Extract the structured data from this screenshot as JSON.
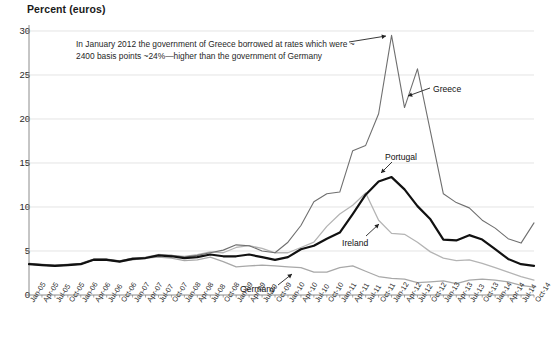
{
  "chart_data": {
    "type": "line",
    "title": "Percent (euros)",
    "ylabel": "Percent (euros)",
    "xlabel": "",
    "ylim": [
      0,
      30
    ],
    "yticks": [
      0,
      5,
      10,
      15,
      20,
      25,
      30
    ],
    "grid": true,
    "legend_position": "inline-annotations",
    "annotations": [
      {
        "name": "greece-callout",
        "line1": "In January 2012 the government of Greece borrowed at rates which were ~",
        "line2": "2400 basis points ~24%—higher than the government of Germany"
      }
    ],
    "inline_labels": [
      {
        "name": "Greece",
        "text": "Greece"
      },
      {
        "name": "Portugal",
        "text": "Portugal"
      },
      {
        "name": "Ireland",
        "text": "Ireland"
      },
      {
        "name": "Germany",
        "text": "Germany"
      }
    ],
    "colors": {
      "greece": "#6f6f6f",
      "portugal": "#111111",
      "ireland": "#b4b4b4",
      "germany": "#a8a8a8",
      "grid": "#d8d8d8",
      "axis": "#808080",
      "background": "#ffffff"
    },
    "categories": [
      "Jan-05",
      "Apr-05",
      "Jul-05",
      "Oct-05",
      "Jan-06",
      "Apr-06",
      "Jul-06",
      "Oct-06",
      "Jan-07",
      "Apr-07",
      "Jul-07",
      "Oct-07",
      "Jan-08",
      "Apr-08",
      "Jul-08",
      "Oct-08",
      "Jan-09",
      "Apr-09",
      "Jul-09",
      "Oct-09",
      "Jan-10",
      "Apr-10",
      "Jul-10",
      "Oct-10",
      "Jan-11",
      "Apr-11",
      "Jul-11",
      "Oct-11",
      "Jan-12",
      "Apr-12",
      "Jul-12",
      "Oct-12",
      "Jan-13",
      "Apr-13",
      "Jul-13",
      "Oct-13",
      "Jan-14",
      "Apr-14",
      "Jul-14",
      "Oct-14"
    ],
    "series": [
      {
        "name": "Greece",
        "color": "#6f6f6f",
        "width": 1.1,
        "values": [
          3.6,
          3.5,
          3.4,
          3.5,
          3.6,
          4.1,
          4.1,
          3.9,
          4.2,
          4.2,
          4.5,
          4.5,
          4.3,
          4.5,
          4.8,
          5.1,
          5.7,
          5.6,
          5.0,
          4.8,
          6.0,
          7.9,
          10.6,
          11.5,
          11.7,
          16.4,
          17.0,
          20.6,
          29.5,
          21.3,
          25.7,
          18.6,
          11.5,
          10.5,
          9.9,
          8.5,
          7.6,
          6.4,
          5.9,
          8.2
        ]
      },
      {
        "name": "Portugal",
        "color": "#111111",
        "width": 2.2,
        "values": [
          3.5,
          3.4,
          3.3,
          3.4,
          3.5,
          4.0,
          4.0,
          3.8,
          4.1,
          4.2,
          4.5,
          4.4,
          4.2,
          4.3,
          4.6,
          4.4,
          4.4,
          4.6,
          4.3,
          4.0,
          4.3,
          5.2,
          5.6,
          6.4,
          7.1,
          9.2,
          11.4,
          12.9,
          13.4,
          12.0,
          10.1,
          8.6,
          6.3,
          6.2,
          6.8,
          6.3,
          5.2,
          4.1,
          3.5,
          3.3
        ]
      },
      {
        "name": "Ireland",
        "color": "#b4b4b4",
        "width": 1.3,
        "values": [
          3.5,
          3.4,
          3.3,
          3.4,
          3.5,
          4.0,
          4.0,
          3.8,
          4.1,
          4.3,
          4.6,
          4.5,
          4.4,
          4.6,
          4.9,
          4.8,
          5.4,
          5.6,
          5.3,
          4.8,
          4.8,
          5.4,
          6.0,
          7.8,
          9.2,
          10.2,
          11.6,
          8.5,
          7.0,
          6.9,
          6.0,
          4.9,
          4.2,
          3.9,
          4.0,
          3.6,
          3.1,
          2.6,
          2.1,
          1.7
        ]
      },
      {
        "name": "Germany",
        "color": "#a8a8a8",
        "width": 1.3,
        "values": [
          3.5,
          3.4,
          3.3,
          3.4,
          3.5,
          4.0,
          4.0,
          3.8,
          4.0,
          4.2,
          4.3,
          4.2,
          3.9,
          4.0,
          4.3,
          3.8,
          3.2,
          3.3,
          3.4,
          3.3,
          3.2,
          3.1,
          2.6,
          2.6,
          3.1,
          3.3,
          2.7,
          2.1,
          1.9,
          1.8,
          1.4,
          1.5,
          1.6,
          1.3,
          1.7,
          1.8,
          1.7,
          1.5,
          1.1,
          0.9
        ]
      }
    ]
  },
  "axis": {
    "title": "Percent (euros)",
    "yticks": [
      "30",
      "25",
      "20",
      "15",
      "10",
      "5",
      "0"
    ]
  }
}
